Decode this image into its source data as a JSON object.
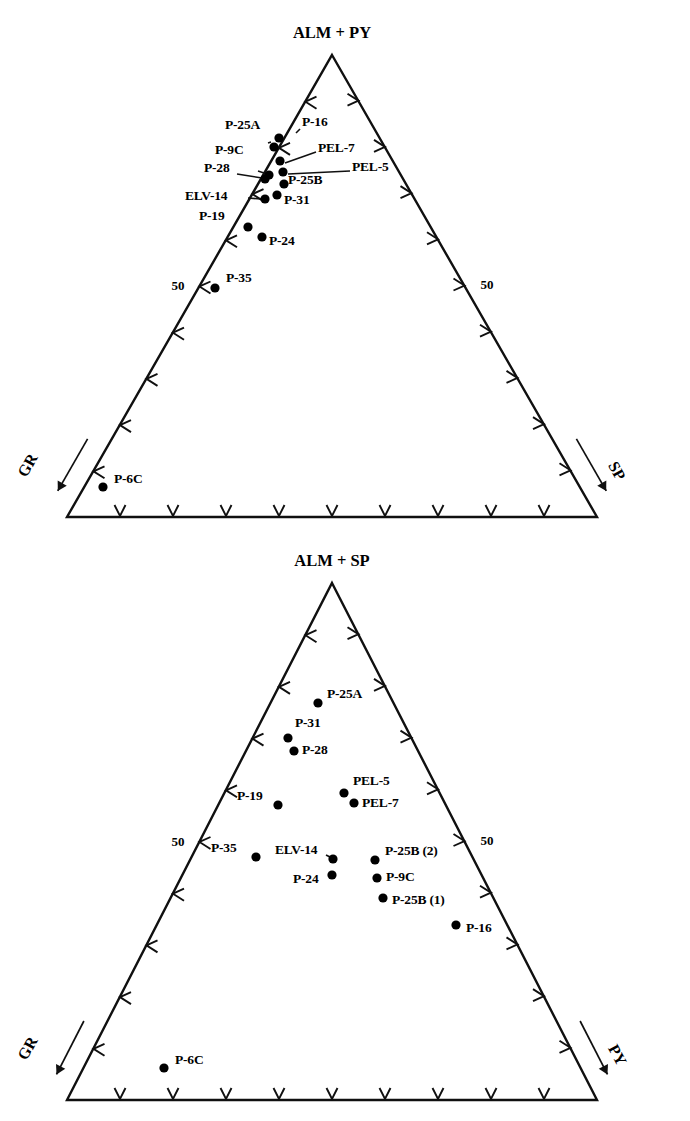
{
  "page": {
    "background": "#ffffff",
    "ink": "#101010",
    "width": 690,
    "height": 1121
  },
  "chart_data": [
    {
      "type": "scatter",
      "plot_kind": "ternary",
      "id": "ternary-top",
      "title": "ALM + PY",
      "apex_label": "ALM + PY",
      "left_label": "GR",
      "right_label": "SP",
      "scale_left": "50",
      "scale_right": "50",
      "ticks_per_side": 10,
      "grid": false,
      "legend": "none",
      "geometry": {
        "apex_x": 332,
        "apex_y": 55,
        "left_x": 67,
        "right_x": 597,
        "base_y": 517
      },
      "points": [
        {
          "label": "P-16",
          "x": 279,
          "y": 138,
          "lx": 302,
          "ly": 122,
          "leader": [
            296,
            133,
            300,
            129
          ],
          "anchor": "start"
        },
        {
          "label": "P-25A",
          "x": 274,
          "y": 147,
          "lx": 225,
          "ly": 125,
          "leader": [
            268,
            143,
            271,
            142
          ],
          "anchor": "start"
        },
        {
          "label": "PEL-7",
          "x": 280,
          "y": 161,
          "lx": 318,
          "ly": 148,
          "leader": [
            285,
            163,
            316,
            152
          ],
          "anchor": "start"
        },
        {
          "label": "PEL-5",
          "x": 283,
          "y": 172,
          "lx": 352,
          "ly": 167,
          "leader": [
            288,
            174,
            350,
            171
          ],
          "anchor": "start"
        },
        {
          "label": "P-9C",
          "x": 269,
          "y": 175,
          "lx": 215,
          "ly": 150,
          "leader": [
            258,
            171,
            264,
            173
          ],
          "anchor": "start"
        },
        {
          "label": "P-28",
          "x": 265,
          "y": 179,
          "lx": 204,
          "ly": 168,
          "leader": [
            237,
            174,
            262,
            178
          ],
          "anchor": "start"
        },
        {
          "label": "P-25B",
          "x": 284,
          "y": 184,
          "lx": 288,
          "ly": 180,
          "leader": null,
          "anchor": "start"
        },
        {
          "label": "P-31",
          "x": 277,
          "y": 195,
          "lx": 284,
          "ly": 200,
          "leader": null,
          "anchor": "start"
        },
        {
          "label": "ELV-14",
          "x": 265,
          "y": 199,
          "lx": 185,
          "ly": 196,
          "leader": [
            248,
            198,
            261,
            199
          ],
          "anchor": "start"
        },
        {
          "label": "P-19",
          "x": 248,
          "y": 227,
          "lx": 199,
          "ly": 216,
          "leader": null,
          "anchor": "start"
        },
        {
          "label": "P-24",
          "x": 262,
          "y": 237,
          "lx": 269,
          "ly": 241,
          "leader": null,
          "anchor": "start"
        },
        {
          "label": "P-35",
          "x": 215,
          "y": 288,
          "lx": 226,
          "ly": 278,
          "leader": null,
          "anchor": "start"
        },
        {
          "label": "P-6C",
          "x": 103,
          "y": 487,
          "lx": 114,
          "ly": 479,
          "leader": null,
          "anchor": "start"
        }
      ]
    },
    {
      "type": "scatter",
      "plot_kind": "ternary",
      "id": "ternary-bottom",
      "title": "ALM + SP",
      "apex_label": "ALM + SP",
      "left_label": "GR",
      "right_label": "PY",
      "scale_left": "50",
      "scale_right": "50",
      "ticks_per_side": 10,
      "grid": false,
      "legend": "none",
      "geometry": {
        "apex_x": 332,
        "apex_y": 583,
        "left_x": 67,
        "right_x": 597,
        "base_y": 1100
      },
      "points": [
        {
          "label": "P-25A",
          "x": 318,
          "y": 703,
          "lx": 327,
          "ly": 694,
          "leader": null,
          "anchor": "start"
        },
        {
          "label": "P-31",
          "x": 288,
          "y": 738,
          "lx": 295,
          "ly": 723,
          "leader": null,
          "anchor": "start"
        },
        {
          "label": "P-28",
          "x": 294,
          "y": 751,
          "lx": 302,
          "ly": 750,
          "leader": null,
          "anchor": "start"
        },
        {
          "label": "PEL-5",
          "x": 344,
          "y": 793,
          "lx": 353,
          "ly": 781,
          "leader": null,
          "anchor": "start"
        },
        {
          "label": "PEL-7",
          "x": 354,
          "y": 803,
          "lx": 362,
          "ly": 803,
          "leader": null,
          "anchor": "start"
        },
        {
          "label": "P-19",
          "x": 278,
          "y": 805,
          "lx": 237,
          "ly": 796,
          "leader": null,
          "anchor": "start"
        },
        {
          "label": "P-35",
          "x": 256,
          "y": 857,
          "lx": 211,
          "ly": 848,
          "leader": null,
          "anchor": "start"
        },
        {
          "label": "ELV-14",
          "x": 333,
          "y": 859,
          "lx": 275,
          "ly": 850,
          "leader": [
            326,
            855,
            330,
            857
          ],
          "anchor": "start"
        },
        {
          "label": "P-25B (2)",
          "x": 375,
          "y": 860,
          "lx": 385,
          "ly": 851,
          "leader": null,
          "anchor": "start"
        },
        {
          "label": "P-24",
          "x": 332,
          "y": 875,
          "lx": 293,
          "ly": 879,
          "leader": null,
          "anchor": "start"
        },
        {
          "label": "P-9C",
          "x": 377,
          "y": 878,
          "lx": 386,
          "ly": 877,
          "leader": null,
          "anchor": "start"
        },
        {
          "label": "P-25B (1)",
          "x": 383,
          "y": 898,
          "lx": 392,
          "ly": 900,
          "leader": null,
          "anchor": "start"
        },
        {
          "label": "P-16",
          "x": 456,
          "y": 925,
          "lx": 466,
          "ly": 928,
          "leader": null,
          "anchor": "start"
        },
        {
          "label": "P-6C",
          "x": 164,
          "y": 1068,
          "lx": 175,
          "ly": 1060,
          "leader": null,
          "anchor": "start"
        }
      ]
    }
  ]
}
